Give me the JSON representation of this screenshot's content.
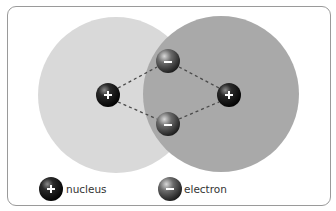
{
  "diagram": {
    "colors": {
      "atom_left": "#d9d9d9",
      "atom_right": "#a9a9a9",
      "bond_line": "#4a4a4a",
      "frame_border": "#9a9a9a",
      "nucleus": "#111111",
      "electron": "#555555"
    },
    "atoms": [
      {
        "id": "atom-left",
        "cx": 116,
        "cy": 95,
        "r": 78
      },
      {
        "id": "atom-right",
        "cx": 221,
        "cy": 94,
        "r": 78
      }
    ],
    "nuclei": [
      {
        "id": "nucleus-left",
        "cx": 108,
        "cy": 95,
        "symbol": "+"
      },
      {
        "id": "nucleus-right",
        "cx": 229,
        "cy": 95,
        "symbol": "+"
      }
    ],
    "electrons": [
      {
        "id": "electron-top",
        "cx": 168,
        "cy": 61,
        "symbol": "−"
      },
      {
        "id": "electron-bottom",
        "cx": 168,
        "cy": 124,
        "symbol": "−"
      }
    ]
  },
  "legend": {
    "items": [
      {
        "icon": "nucleus-icon",
        "symbol": "+",
        "label": "nucleus"
      },
      {
        "icon": "electron-icon",
        "symbol": "−",
        "label": "electron"
      }
    ]
  }
}
